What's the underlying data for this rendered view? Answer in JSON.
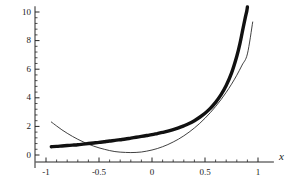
{
  "chart_data": {
    "type": "line",
    "title": "",
    "subtitle": "",
    "xlabel": "x",
    "ylabel": "",
    "xlim": [
      -1.1,
      1.15
    ],
    "ylim": [
      -0.55,
      10.4
    ],
    "grid": false,
    "legend": null,
    "x_ticks": [
      {
        "value": -1,
        "label": "-1"
      },
      {
        "value": -0.5,
        "label": "-0.5"
      },
      {
        "value": 0,
        "label": "0"
      },
      {
        "value": 0.5,
        "label": "0.5"
      },
      {
        "value": 1,
        "label": "1"
      }
    ],
    "y_ticks": [
      {
        "value": 0,
        "label": "0"
      },
      {
        "value": 2,
        "label": "2"
      },
      {
        "value": 4,
        "label": "4"
      },
      {
        "value": 6,
        "label": "6"
      },
      {
        "value": 8,
        "label": "8"
      },
      {
        "value": 10,
        "label": "10"
      }
    ],
    "x_minor_tick_step": 0.1,
    "y_minor_tick_step": 0.4,
    "series": [
      {
        "name": "thin-curve",
        "style": "thin",
        "color": "#2b2b2b",
        "width": 0.9,
        "x": [
          -0.95,
          -0.9,
          -0.85,
          -0.8,
          -0.75,
          -0.7,
          -0.65,
          -0.6,
          -0.55,
          -0.5,
          -0.45,
          -0.4,
          -0.35,
          -0.3,
          -0.25,
          -0.2,
          -0.15,
          -0.1,
          -0.05,
          0,
          0.05,
          0.1,
          0.15,
          0.2,
          0.25,
          0.3,
          0.35,
          0.4,
          0.45,
          0.5,
          0.55,
          0.6,
          0.65,
          0.7,
          0.75,
          0.8,
          0.85,
          0.9,
          0.95
        ],
        "y": [
          2.31,
          2.03,
          1.76,
          1.52,
          1.3,
          1.1,
          0.92,
          0.76,
          0.62,
          0.5,
          0.4,
          0.31,
          0.24,
          0.2,
          0.18,
          0.17,
          0.18,
          0.21,
          0.27,
          0.35,
          0.45,
          0.58,
          0.73,
          0.91,
          1.11,
          1.34,
          1.6,
          1.89,
          2.21,
          2.57,
          2.96,
          3.39,
          3.86,
          4.38,
          4.95,
          5.58,
          6.29,
          7.07,
          9.3
        ]
      },
      {
        "name": "thick-curve",
        "style": "thick",
        "color": "#111111",
        "width": 3.4,
        "x": [
          -0.95,
          -0.9,
          -0.85,
          -0.8,
          -0.75,
          -0.7,
          -0.65,
          -0.6,
          -0.55,
          -0.5,
          -0.45,
          -0.4,
          -0.35,
          -0.3,
          -0.25,
          -0.2,
          -0.15,
          -0.1,
          -0.05,
          0,
          0.05,
          0.1,
          0.15,
          0.2,
          0.25,
          0.3,
          0.35,
          0.4,
          0.45,
          0.5,
          0.55,
          0.6,
          0.65,
          0.7,
          0.75,
          0.8,
          0.83,
          0.86,
          0.88,
          0.895,
          0.9
        ],
        "y": [
          0.58,
          0.6,
          0.63,
          0.66,
          0.69,
          0.72,
          0.76,
          0.8,
          0.84,
          0.88,
          0.93,
          0.98,
          1.02,
          1.07,
          1.12,
          1.18,
          1.24,
          1.3,
          1.36,
          1.42,
          1.5,
          1.58,
          1.67,
          1.78,
          1.9,
          2.04,
          2.2,
          2.4,
          2.64,
          2.92,
          3.26,
          3.68,
          4.2,
          4.86,
          5.72,
          6.9,
          7.8,
          8.9,
          9.6,
          10.1,
          10.35
        ]
      }
    ],
    "crossings": [
      {
        "x": -0.71,
        "y": 0.75
      },
      {
        "x": 0.22,
        "y": 1.8
      },
      {
        "x": 0.9,
        "y": 7.07
      }
    ]
  },
  "axis": {
    "x_name": "x",
    "y_name": ""
  }
}
